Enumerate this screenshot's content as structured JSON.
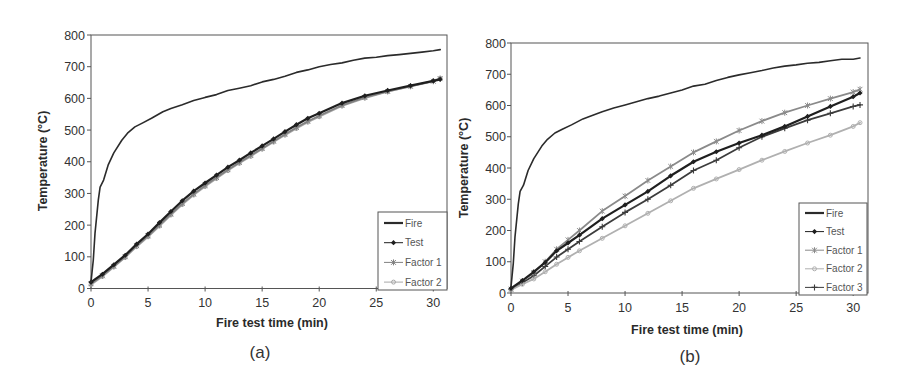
{
  "chart_data": [
    {
      "type": "line",
      "panel_label": "(a)",
      "title": "",
      "xlabel": "Fire test time (min)",
      "ylabel": "Temperature (°C)",
      "xlim": [
        0,
        31.2
      ],
      "ylim": [
        0,
        800
      ],
      "xticks": [
        0,
        5,
        10,
        15,
        20,
        25,
        30
      ],
      "yticks": [
        0,
        100,
        200,
        300,
        400,
        500,
        600,
        700,
        800
      ],
      "grid": false,
      "legend": "bottom-right",
      "series": [
        {
          "name": "Fire",
          "marker": "none",
          "color": "#2b2b2b",
          "x": [
            0,
            0.2,
            0.35,
            0.64,
            0.8,
            1.1,
            1.5,
            2,
            2.7,
            3.2,
            3.85,
            4.5,
            5.3,
            6.3,
            7,
            8,
            9,
            10,
            11,
            12,
            13,
            14,
            15,
            16,
            17,
            18,
            19,
            20,
            21,
            22,
            23,
            24,
            25,
            26,
            27,
            28,
            29,
            30,
            30.6
          ],
          "y": [
            20,
            90,
            174,
            279,
            320,
            342,
            389,
            428,
            468,
            490,
            510,
            522,
            537,
            558,
            568,
            580,
            593,
            603,
            612,
            625,
            632,
            640,
            652,
            660,
            670,
            682,
            690,
            700,
            707,
            712,
            720,
            727,
            730,
            735,
            738,
            742,
            746,
            750,
            754
          ]
        },
        {
          "name": "Test",
          "marker": "diamond",
          "color": "#1f1f1f",
          "x": [
            0,
            1,
            2,
            3,
            4,
            5,
            6,
            7,
            8,
            9,
            10,
            11,
            12,
            13,
            14,
            15,
            16,
            17,
            18,
            19,
            20,
            22,
            24,
            26,
            28,
            30,
            30.6
          ],
          "y": [
            20,
            45,
            75,
            105,
            140,
            172,
            208,
            243,
            277,
            307,
            333,
            358,
            383,
            405,
            428,
            450,
            472,
            495,
            517,
            537,
            553,
            585,
            608,
            625,
            640,
            655,
            660
          ]
        },
        {
          "name": "Factor 1",
          "marker": "star",
          "color": "#808080",
          "x": [
            0,
            1,
            2,
            3,
            4,
            5,
            6,
            7,
            8,
            9,
            10,
            11,
            12,
            13,
            14,
            15,
            16,
            17,
            18,
            19,
            20,
            22,
            24,
            26,
            28,
            30,
            30.6
          ],
          "y": [
            15,
            40,
            70,
            100,
            135,
            166,
            200,
            235,
            268,
            298,
            325,
            350,
            375,
            398,
            420,
            442,
            465,
            487,
            508,
            528,
            545,
            578,
            603,
            622,
            638,
            654,
            662
          ]
        },
        {
          "name": "Factor 2",
          "marker": "circle",
          "color": "#a8a8a8",
          "x": [
            0,
            1,
            2,
            3,
            4,
            5,
            6,
            7,
            8,
            9,
            10,
            11,
            12,
            13,
            14,
            15,
            16,
            17,
            18,
            19,
            20,
            22,
            24,
            26,
            28,
            30,
            30.6
          ],
          "y": [
            12,
            38,
            68,
            98,
            132,
            163,
            197,
            232,
            265,
            295,
            322,
            347,
            372,
            395,
            417,
            440,
            462,
            484,
            505,
            525,
            542,
            576,
            601,
            621,
            638,
            655,
            664
          ]
        }
      ]
    },
    {
      "type": "line",
      "panel_label": "(b)",
      "title": "",
      "xlabel": "Fire test time (min)",
      "ylabel": "Temperature (°C)",
      "xlim": [
        0,
        31.3
      ],
      "ylim": [
        0,
        800
      ],
      "xticks": [
        0,
        5,
        10,
        15,
        20,
        25,
        30
      ],
      "yticks": [
        0,
        100,
        200,
        300,
        400,
        500,
        600,
        700,
        800
      ],
      "grid": false,
      "legend": "bottom-right",
      "series": [
        {
          "name": "Fire",
          "marker": "none",
          "color": "#2b2b2b",
          "x": [
            0,
            0.2,
            0.35,
            0.64,
            0.8,
            1.1,
            1.5,
            2,
            2.7,
            3.2,
            3.85,
            4.5,
            5.3,
            6.3,
            7,
            8,
            9,
            10,
            11,
            12,
            13,
            14,
            15,
            16,
            17,
            18,
            19,
            20,
            21,
            22,
            23,
            24,
            25,
            26,
            27,
            28,
            29,
            30,
            30.6
          ],
          "y": [
            20,
            95,
            180,
            285,
            325,
            345,
            392,
            430,
            470,
            492,
            512,
            524,
            538,
            557,
            566,
            580,
            592,
            602,
            612,
            622,
            630,
            640,
            650,
            662,
            668,
            680,
            690,
            698,
            705,
            712,
            720,
            726,
            730,
            735,
            738,
            743,
            748,
            748,
            752
          ]
        },
        {
          "name": "Test",
          "marker": "diamond",
          "color": "#1f1f1f",
          "x": [
            0,
            1,
            2,
            3,
            4,
            5,
            6,
            8,
            10,
            12,
            14,
            16,
            18,
            20,
            22,
            24,
            26,
            28,
            30,
            30.6
          ],
          "y": [
            15,
            40,
            68,
            98,
            135,
            160,
            185,
            238,
            282,
            325,
            375,
            420,
            452,
            480,
            505,
            533,
            565,
            597,
            628,
            640
          ]
        },
        {
          "name": "Factor 1",
          "marker": "star",
          "color": "#8a8a8a",
          "x": [
            0,
            1,
            2,
            3,
            4,
            5,
            6,
            8,
            10,
            12,
            14,
            16,
            18,
            20,
            22,
            24,
            26,
            28,
            30,
            30.6
          ],
          "y": [
            12,
            38,
            65,
            100,
            140,
            170,
            200,
            262,
            310,
            360,
            405,
            450,
            485,
            520,
            550,
            577,
            600,
            622,
            643,
            652
          ]
        },
        {
          "name": "Factor 2",
          "marker": "circle",
          "color": "#b0b0b0",
          "x": [
            0,
            1,
            2,
            3,
            4,
            5,
            6,
            8,
            10,
            12,
            14,
            16,
            18,
            20,
            22,
            24,
            26,
            28,
            30,
            30.6
          ],
          "y": [
            10,
            28,
            45,
            68,
            92,
            114,
            135,
            175,
            215,
            255,
            295,
            335,
            365,
            395,
            425,
            453,
            480,
            505,
            533,
            545
          ]
        },
        {
          "name": "Factor 3",
          "marker": "plus",
          "color": "#3c3c3c",
          "x": [
            0,
            1,
            2,
            3,
            4,
            5,
            6,
            8,
            10,
            12,
            14,
            16,
            18,
            20,
            22,
            24,
            26,
            28,
            30,
            30.6
          ],
          "y": [
            12,
            33,
            55,
            85,
            115,
            140,
            165,
            212,
            258,
            300,
            345,
            392,
            425,
            465,
            500,
            527,
            553,
            575,
            597,
            602
          ]
        }
      ]
    }
  ]
}
